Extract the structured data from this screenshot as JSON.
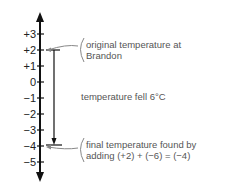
{
  "diagram": {
    "type": "vertical number line",
    "ticks": [
      "+3",
      "+2",
      "+1",
      "0",
      "−1",
      "−2",
      "−3",
      "−4",
      "−5"
    ],
    "annotations": {
      "original": [
        "original temperature at",
        "Brandon"
      ],
      "fall": "temperature fell 6°C",
      "final": [
        "final temperature found by",
        "adding (+2) + (−6) = (−4)"
      ]
    },
    "start_value": 2,
    "change": -6,
    "end_value": -4,
    "colors": {
      "axis": "#111111",
      "annotation_text": "#555555",
      "leader": "#888888"
    }
  }
}
